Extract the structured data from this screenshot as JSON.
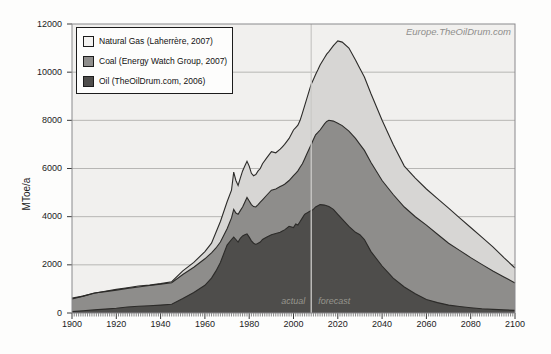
{
  "watermark": "Europe.TheOilDrum.com",
  "y_axis": {
    "label": "MToe/a",
    "ticks": [
      0,
      2000,
      4000,
      6000,
      8000,
      10000,
      12000
    ]
  },
  "x_axis": {
    "major_ticks": [
      1900,
      1920,
      1940,
      1960,
      1980,
      2000,
      2020,
      2040,
      2060,
      2080,
      2100
    ],
    "minor_step_years": 1
  },
  "annotations": {
    "actual_label": "actual",
    "forecast_label": "forecast",
    "divider_year": 2008
  },
  "legend": [
    {
      "label": "Natural Gas  (Laherrère, 2007)",
      "swatch_color": "#f4f3f1"
    },
    {
      "label": "Coal  (Energy Watch Group, 2007)",
      "swatch_color": "#8e8d8b"
    },
    {
      "label": "Oil  (TheOilDrum.com, 2006)",
      "swatch_color": "#4e4d4b"
    }
  ],
  "colors": {
    "page_bg": "#fdfdfc",
    "plot_bg": "#f1f0ee",
    "plot_border": "#8a898c",
    "grid": "#b7b6b4",
    "edge": "#2c2b29",
    "divider": "#cbcac8",
    "tick": "#3a3a3a"
  },
  "chart_data": {
    "type": "area",
    "stacked": true,
    "title": "",
    "ylabel": "MToe/a",
    "xlabel": "",
    "xlim": [
      1900,
      2100
    ],
    "ylim": [
      0,
      12000
    ],
    "grid": "horizontal",
    "legend_position": "top-left",
    "x": [
      1900,
      1905,
      1910,
      1915,
      1920,
      1925,
      1930,
      1935,
      1940,
      1945,
      1950,
      1955,
      1960,
      1963,
      1965,
      1967,
      1970,
      1972,
      1973,
      1974,
      1975,
      1976,
      1977,
      1978,
      1979,
      1980,
      1981,
      1982,
      1983,
      1984,
      1985,
      1986,
      1988,
      1990,
      1992,
      1994,
      1995,
      1996,
      1998,
      2000,
      2001,
      2002,
      2003,
      2004,
      2005,
      2006,
      2007,
      2008,
      2009,
      2010,
      2011,
      2012,
      2014,
      2015,
      2016,
      2018,
      2020,
      2022,
      2025,
      2028,
      2030,
      2032,
      2035,
      2040,
      2045,
      2050,
      2055,
      2060,
      2065,
      2070,
      2075,
      2080,
      2085,
      2090,
      2095,
      2100
    ],
    "series": [
      {
        "name": "Oil",
        "source": "TheOilDrum.com, 2006",
        "color": "#4e4d4b",
        "cumulative_top": [
          60,
          90,
          130,
          160,
          200,
          250,
          280,
          300,
          330,
          360,
          600,
          850,
          1150,
          1450,
          1750,
          2100,
          2820,
          3050,
          3150,
          3050,
          2950,
          3100,
          3200,
          3250,
          3280,
          3150,
          3000,
          2900,
          2850,
          2900,
          2950,
          3050,
          3150,
          3250,
          3300,
          3350,
          3400,
          3450,
          3600,
          3550,
          3700,
          3650,
          3800,
          3950,
          4100,
          4150,
          4200,
          4250,
          4300,
          4400,
          4450,
          4500,
          4480,
          4450,
          4420,
          4300,
          4100,
          3900,
          3600,
          3350,
          3250,
          3050,
          2550,
          1950,
          1450,
          1080,
          800,
          560,
          430,
          330,
          270,
          220,
          180,
          150,
          130,
          110
        ]
      },
      {
        "name": "Coal",
        "source": "Energy Watch Group, 2007",
        "color": "#8e8d8b",
        "cumulative_top": [
          580,
          700,
          830,
          890,
          950,
          1020,
          1080,
          1140,
          1200,
          1260,
          1600,
          1900,
          2250,
          2500,
          2700,
          2950,
          3500,
          3950,
          4300,
          4150,
          4100,
          4250,
          4400,
          4600,
          4800,
          4650,
          4500,
          4420,
          4400,
          4500,
          4600,
          4700,
          4900,
          5100,
          5150,
          5250,
          5300,
          5350,
          5500,
          5700,
          5800,
          5900,
          6050,
          6200,
          6400,
          6600,
          6800,
          7000,
          7200,
          7400,
          7500,
          7600,
          7850,
          7950,
          8000,
          7970,
          7880,
          7780,
          7550,
          7250,
          7000,
          6750,
          6250,
          5500,
          4920,
          4400,
          4000,
          3650,
          3270,
          2900,
          2600,
          2300,
          2020,
          1750,
          1500,
          1250
        ]
      },
      {
        "name": "Natural Gas",
        "source": "Laherrère, 2007",
        "color": "#d7d6d4",
        "cumulative_top": [
          620,
          700,
          820,
          900,
          980,
          1050,
          1120,
          1160,
          1220,
          1300,
          1750,
          2100,
          2550,
          2900,
          3350,
          3800,
          4620,
          5100,
          5850,
          5500,
          5300,
          5600,
          5900,
          6100,
          6300,
          6100,
          5800,
          5700,
          5750,
          5900,
          6000,
          6200,
          6450,
          6700,
          6650,
          6800,
          6900,
          7000,
          7250,
          7600,
          7700,
          7800,
          8000,
          8300,
          8600,
          8900,
          9200,
          9500,
          9700,
          9900,
          10100,
          10300,
          10600,
          10750,
          10850,
          11100,
          11300,
          11250,
          11000,
          10500,
          10150,
          9800,
          9100,
          8000,
          7000,
          6100,
          5600,
          5150,
          4750,
          4350,
          3950,
          3550,
          3150,
          2750,
          2300,
          1870
        ]
      }
    ]
  }
}
